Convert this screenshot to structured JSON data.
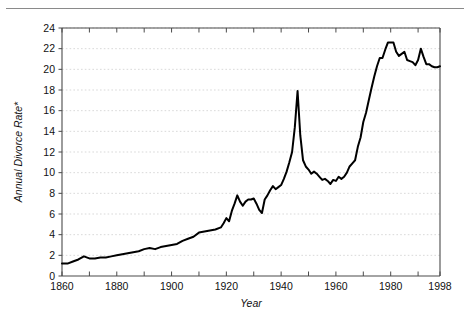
{
  "figure": {
    "top_rule": true
  },
  "chart_data": {
    "type": "line",
    "title": "",
    "xlabel": "Year",
    "ylabel": "Annual Divorce Rate*",
    "xlim": [
      1860,
      1998
    ],
    "ylim": [
      0,
      24
    ],
    "grid": true,
    "legend": "none",
    "x_ticks_major": [
      1860,
      1880,
      1900,
      1920,
      1940,
      1960,
      1980,
      1998
    ],
    "x_ticks_minor": [
      1870,
      1890,
      1910,
      1930,
      1950,
      1970,
      1990
    ],
    "x_tick_labels": [
      "1860",
      "1880",
      "1900",
      "1920",
      "1940",
      "1960",
      "1980",
      "1998"
    ],
    "y_ticks": [
      0,
      2,
      4,
      6,
      8,
      10,
      12,
      14,
      16,
      18,
      20,
      22,
      24
    ],
    "y_tick_labels": [
      "0",
      "2",
      "4",
      "6",
      "8",
      "10",
      "12",
      "14",
      "16",
      "18",
      "20",
      "22",
      "24"
    ],
    "series": [
      {
        "name": "Annual Divorce Rate",
        "color": "#000000",
        "x": [
          1860,
          1862,
          1864,
          1866,
          1868,
          1870,
          1872,
          1874,
          1876,
          1878,
          1880,
          1882,
          1884,
          1886,
          1888,
          1890,
          1892,
          1894,
          1896,
          1898,
          1900,
          1902,
          1904,
          1906,
          1908,
          1910,
          1912,
          1914,
          1916,
          1918,
          1919,
          1920,
          1921,
          1922,
          1923,
          1924,
          1925,
          1926,
          1927,
          1928,
          1929,
          1930,
          1931,
          1932,
          1933,
          1934,
          1935,
          1936,
          1937,
          1938,
          1939,
          1940,
          1941,
          1942,
          1943,
          1944,
          1945,
          1946,
          1947,
          1948,
          1949,
          1950,
          1951,
          1952,
          1953,
          1954,
          1955,
          1956,
          1957,
          1958,
          1959,
          1960,
          1961,
          1962,
          1963,
          1964,
          1965,
          1966,
          1967,
          1968,
          1969,
          1970,
          1971,
          1972,
          1973,
          1974,
          1975,
          1976,
          1977,
          1978,
          1979,
          1980,
          1981,
          1982,
          1983,
          1984,
          1985,
          1986,
          1987,
          1988,
          1989,
          1990,
          1991,
          1992,
          1993,
          1994,
          1995,
          1996,
          1997,
          1998
        ],
        "values": [
          1.2,
          1.2,
          1.4,
          1.6,
          1.9,
          1.7,
          1.7,
          1.8,
          1.8,
          1.9,
          2.0,
          2.1,
          2.2,
          2.3,
          2.4,
          2.6,
          2.7,
          2.6,
          2.8,
          2.9,
          3.0,
          3.1,
          3.4,
          3.6,
          3.8,
          4.2,
          4.3,
          4.4,
          4.5,
          4.7,
          5.1,
          5.6,
          5.3,
          6.3,
          7.0,
          7.8,
          7.2,
          6.8,
          7.2,
          7.4,
          7.4,
          7.5,
          7.0,
          6.4,
          6.1,
          7.4,
          7.8,
          8.3,
          8.7,
          8.4,
          8.6,
          8.8,
          9.4,
          10.1,
          11.0,
          12.0,
          14.4,
          17.9,
          13.6,
          11.2,
          10.6,
          10.3,
          9.9,
          10.1,
          9.9,
          9.6,
          9.3,
          9.4,
          9.2,
          8.9,
          9.3,
          9.2,
          9.6,
          9.4,
          9.6,
          10.0,
          10.6,
          10.9,
          11.2,
          12.5,
          13.4,
          14.9,
          15.8,
          17.0,
          18.2,
          19.3,
          20.3,
          21.1,
          21.1,
          21.9,
          22.6,
          22.6,
          22.6,
          21.7,
          21.3,
          21.5,
          21.7,
          20.9,
          20.8,
          20.7,
          20.4,
          20.9,
          22.0,
          21.2,
          20.5,
          20.5,
          20.3,
          20.2,
          20.2,
          20.3
        ]
      }
    ],
    "footnote_marker": "*"
  }
}
